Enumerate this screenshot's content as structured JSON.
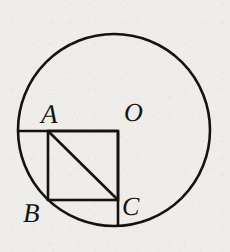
{
  "figure": {
    "kind": "plane-geometry-diagram",
    "canvas": {
      "width": 230,
      "height": 252
    },
    "background_color": "#efedea",
    "stroke_color": "#15130f",
    "labels": {
      "A": "A",
      "O": "O",
      "B": "B",
      "C": "C"
    },
    "label_positions": {
      "A": {
        "x": 50,
        "y": 115,
        "anchor": "above-left-of-square-top-left"
      },
      "O": {
        "x": 133,
        "y": 113,
        "anchor": "circle-center-label"
      },
      "B": {
        "x": 31,
        "y": 213,
        "anchor": "below-left-of-square-bottom-left"
      },
      "C": {
        "x": 130,
        "y": 207,
        "anchor": "right-of-square-bottom-right"
      }
    },
    "circle": {
      "center": {
        "x": 114,
        "y": 130
      },
      "radius": 96,
      "stroke_width": 2.6,
      "fill": "none"
    },
    "square": {
      "top_left": {
        "x": 48,
        "y": 131
      },
      "top_right": {
        "x": 118,
        "y": 131
      },
      "bottom_right": {
        "x": 118,
        "y": 200
      },
      "bottom_left": {
        "x": 48,
        "y": 200
      },
      "side_length": 70,
      "stroke_width": 2.6,
      "fill": "none"
    },
    "diagonal": {
      "from": {
        "x": 48,
        "y": 131
      },
      "to": {
        "x": 118,
        "y": 200
      },
      "stroke_width": 2.6
    },
    "chord_horizontal": {
      "description": "horizontal segment from circle edge on the left to square top-right corner",
      "from": {
        "x": 19,
        "y": 131
      },
      "to": {
        "x": 118,
        "y": 131
      },
      "stroke_width": 2.6
    },
    "chord_vertical": {
      "description": "vertical segment from square top-right corner down through C to circle bottom",
      "from": {
        "x": 118,
        "y": 131
      },
      "to": {
        "x": 118,
        "y": 235
      },
      "stroke_width": 2.6
    }
  }
}
